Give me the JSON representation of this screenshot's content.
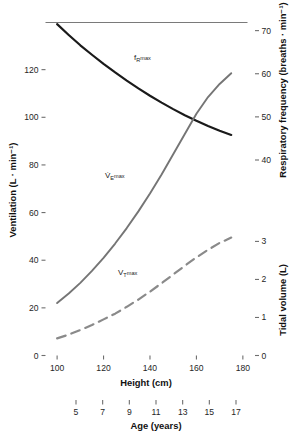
{
  "chart_data": {
    "type": "line",
    "title": "",
    "xlabel": "Height (cm)",
    "xlim": [
      95,
      182
    ],
    "x_ticks": [
      100,
      120,
      140,
      160,
      180
    ],
    "x_tick_labels": [
      "100",
      "120",
      "140",
      "160",
      "180"
    ],
    "secondary_x": {
      "label": "Age (years)",
      "ticks": [
        5,
        7,
        9,
        11,
        13,
        15,
        17
      ],
      "tick_labels": [
        "5",
        "7",
        "9",
        "11",
        "13",
        "15",
        "17"
      ],
      "lim": [
        5,
        17
      ]
    },
    "axes": [
      {
        "id": "ventilation",
        "side": "left",
        "label": "Ventilation (L · min⁻¹)",
        "ticks": [
          0,
          20,
          40,
          60,
          80,
          100,
          120
        ],
        "tick_labels": [
          "0",
          "20",
          "40",
          "60",
          "80",
          "100",
          "120"
        ],
        "lim": [
          0,
          140
        ]
      },
      {
        "id": "respiratory-frequency",
        "side": "right-upper",
        "label": "Respiratory frequency (breaths · min⁻¹)",
        "ticks": [
          40,
          50,
          60,
          70
        ],
        "tick_labels": [
          "40",
          "50",
          "60",
          "70"
        ],
        "lim": [
          40,
          72
        ]
      },
      {
        "id": "tidal-volume",
        "side": "right-lower",
        "label": "Tidal volume (L)",
        "ticks": [
          0,
          1,
          2,
          3
        ],
        "tick_labels": [
          "0",
          "1",
          "2",
          "3"
        ],
        "lim": [
          0,
          3.3
        ]
      }
    ],
    "grid": false,
    "legend": "inline-curve-labels",
    "series": [
      {
        "name": "fRmax",
        "label_html": "f<sub>R</sub>max",
        "axis": "respiratory-frequency",
        "color": "#1a1a1a",
        "style": "solid",
        "width": 2.2,
        "x": [
          100,
          105,
          110,
          115,
          120,
          125,
          130,
          135,
          140,
          145,
          150,
          155,
          160,
          165,
          170,
          175
        ],
        "y": [
          71.5,
          69.0,
          66.6,
          64.4,
          62.3,
          60.3,
          58.4,
          56.6,
          54.9,
          53.3,
          51.8,
          50.4,
          49.1,
          47.9,
          46.8,
          45.8
        ]
      },
      {
        "name": "VEmax",
        "label_html": "V̇<sub>E</sub>max",
        "axis": "ventilation",
        "color": "#757575",
        "style": "solid",
        "width": 1.9,
        "x": [
          100,
          105,
          110,
          115,
          120,
          125,
          130,
          135,
          140,
          145,
          150,
          155,
          160,
          165,
          170,
          175
        ],
        "y": [
          22,
          26,
          30.5,
          35.5,
          41,
          47,
          53.5,
          60.5,
          68,
          76,
          84.5,
          93,
          101.5,
          108.5,
          114,
          118.5
        ]
      },
      {
        "name": "VTmax",
        "label_html": "V<sub>T</sub>max",
        "axis": "tidal-volume",
        "color": "#8a8a8a",
        "style": "dashed",
        "width": 2.2,
        "x": [
          100,
          105,
          110,
          115,
          120,
          125,
          130,
          135,
          140,
          145,
          150,
          155,
          160,
          165,
          170,
          175
        ],
        "y": [
          0.45,
          0.55,
          0.67,
          0.8,
          0.95,
          1.1,
          1.28,
          1.47,
          1.68,
          1.9,
          2.13,
          2.36,
          2.58,
          2.78,
          2.96,
          3.1
        ]
      }
    ],
    "annotations": [
      {
        "name": "fRmax-label",
        "text": "fRmax",
        "x": 134,
        "y": 57
      },
      {
        "name": "VEmax-label",
        "text": "VEmax",
        "x": 110,
        "y": 175
      },
      {
        "name": "VTmax-label",
        "text": "VTmax",
        "x": 122,
        "y": 272
      }
    ]
  },
  "labels": {
    "y_left_title": "Ventilation (L · min⁻¹)",
    "y_right_upper_title": "Respiratory frequency (breaths · min⁻¹)",
    "y_right_lower_title": "Tidal volume (L)",
    "x_title": "Height (cm)",
    "age_title": "Age (years)",
    "curve_fr": "f",
    "curve_fr_sub": "R",
    "curve_fr_tail": "max",
    "curve_ve": "V̇",
    "curve_ve_sub": "E",
    "curve_ve_tail": "max",
    "curve_vt": "V",
    "curve_vt_sub": "T",
    "curve_vt_tail": "max",
    "y_left_ticks": [
      "0",
      "20",
      "40",
      "60",
      "80",
      "100",
      "120"
    ],
    "y_rf_ticks": [
      "40",
      "50",
      "60",
      "70"
    ],
    "y_tv_ticks": [
      "0",
      "1",
      "2",
      "3"
    ],
    "x_ticks": [
      "100",
      "120",
      "140",
      "160",
      "180"
    ],
    "age_ticks": [
      "5",
      "7",
      "9",
      "11",
      "13",
      "15",
      "17"
    ]
  },
  "colors": {
    "fr_curve": "#1a1a1a",
    "ve_curve": "#757575",
    "vt_curve": "#8a8a8a",
    "axis": "#6b6b6b",
    "text": "#1a1a1a",
    "background": "#ffffff"
  }
}
